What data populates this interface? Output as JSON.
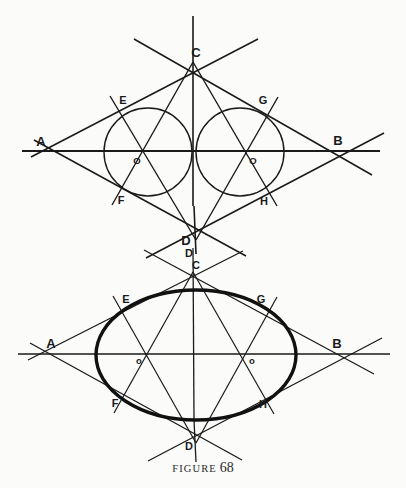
{
  "figure": {
    "caption_word": "FIGURE",
    "caption_number": "68",
    "background_color": "#fbfbfa",
    "ink_color": "#1a1a1a"
  },
  "upper_diagram": {
    "name": "four-centered-arc-construction",
    "description": "Rhombus ABCD with two tangent inscribed circles",
    "labels": {
      "A": "A",
      "B": "B",
      "C": "C",
      "D": "D",
      "E": "E",
      "F": "F",
      "G": "G",
      "H": "H",
      "O_left": "O",
      "O_right": "O"
    },
    "points": {
      "A": [
        50,
        151
      ],
      "B": [
        337,
        151
      ],
      "C": [
        193,
        62
      ],
      "D": [
        196,
        240
      ],
      "E": [
        122,
        112
      ],
      "F": [
        124,
        192
      ],
      "G": [
        265,
        112
      ],
      "H": [
        264,
        192
      ],
      "O_left": [
        148,
        152
      ],
      "O_right": [
        240,
        152
      ]
    },
    "circles": [
      {
        "cx": 148,
        "cy": 152,
        "r": 44
      },
      {
        "cx": 240,
        "cy": 152,
        "r": 44
      }
    ],
    "axes": {
      "horizontal": {
        "y": 151,
        "x1": 22,
        "x2": 380
      },
      "vertical": {
        "x": 193,
        "y1": 16,
        "y2": 252
      }
    }
  },
  "lower_diagram": {
    "name": "resulting-approximate-ellipse",
    "description": "Same construction with the four-centered ellipse drawn in",
    "labels": {
      "A": "A",
      "B": "B",
      "C": "C",
      "D": "D",
      "D_stray": "D",
      "E": "E",
      "F": "F",
      "G": "G",
      "H": "H",
      "O_left": "o",
      "O_right": "o"
    },
    "points": {
      "A": [
        50,
        354
      ],
      "B": [
        337,
        354
      ],
      "C": [
        193,
        272
      ],
      "D": [
        196,
        443
      ],
      "E": [
        124,
        310
      ],
      "F": [
        126,
        400
      ],
      "G": [
        264,
        310
      ],
      "H": [
        263,
        400
      ],
      "O_left": [
        147,
        355
      ],
      "O_right": [
        248,
        355
      ]
    },
    "ellipse": {
      "cx": 196,
      "cy": 355,
      "rx": 100,
      "ry": 65
    },
    "axes": {
      "horizontal": {
        "y": 354,
        "x1": 18,
        "x2": 390
      },
      "vertical": {
        "x": 193,
        "y1": 248,
        "y2": 462
      }
    }
  }
}
